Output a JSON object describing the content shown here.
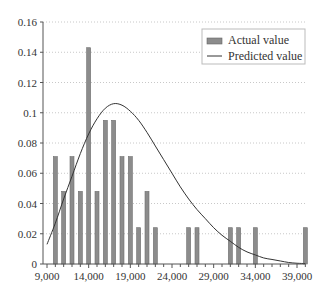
{
  "chart_data": {
    "type": "bar",
    "title": "",
    "xlabel": "",
    "ylabel": "",
    "xlim": [
      9000,
      40000
    ],
    "ylim": [
      0,
      0.16
    ],
    "grid": {
      "horizontal": true,
      "style": "dotted"
    },
    "legend_position": "upper right",
    "x_ticks": [
      "9,000",
      "14,000",
      "19,000",
      "24,000",
      "29,000",
      "34,000",
      "39,000"
    ],
    "x_tick_values": [
      9000,
      14000,
      19000,
      24000,
      29000,
      34000,
      39000
    ],
    "y_ticks": [
      "0",
      "0.02",
      "0.04",
      "0.06",
      "0.08",
      "0.1",
      "0.12",
      "0.14",
      "0.16"
    ],
    "y_tick_values": [
      0,
      0.02,
      0.04,
      0.06,
      0.08,
      0.1,
      0.12,
      0.14,
      0.16
    ],
    "series": [
      {
        "name": "Actual value",
        "type": "bar",
        "color": "#8c8c8c",
        "x": [
          10000,
          11000,
          12000,
          13000,
          14000,
          15000,
          16000,
          17000,
          18000,
          19000,
          20000,
          21000,
          22000,
          26000,
          27000,
          31000,
          32000,
          34000,
          40000
        ],
        "values": [
          0.071,
          0.048,
          0.071,
          0.048,
          0.143,
          0.048,
          0.095,
          0.095,
          0.071,
          0.071,
          0.024,
          0.048,
          0.024,
          0.024,
          0.024,
          0.024,
          0.024,
          0.024,
          0.024
        ]
      },
      {
        "name": "Predicted value",
        "type": "line",
        "color": "#333333",
        "x": [
          9000,
          10000,
          11000,
          12000,
          13000,
          14000,
          15000,
          16000,
          17000,
          18000,
          19000,
          20000,
          21000,
          22000,
          23000,
          24000,
          25000,
          26000,
          27000,
          28000,
          29000,
          30000,
          31000,
          32000,
          33000,
          34000,
          35000,
          36000,
          37000,
          38000,
          39000,
          40000
        ],
        "values": [
          0.013,
          0.027,
          0.043,
          0.058,
          0.073,
          0.086,
          0.096,
          0.103,
          0.106,
          0.105,
          0.101,
          0.095,
          0.087,
          0.078,
          0.069,
          0.06,
          0.051,
          0.043,
          0.036,
          0.03,
          0.024,
          0.019,
          0.015,
          0.011,
          0.008,
          0.006,
          0.004,
          0.003,
          0.002,
          0.001,
          0.0005,
          0.0003
        ]
      }
    ]
  },
  "legend": {
    "items": [
      {
        "label": "Actual value",
        "kind": "bar"
      },
      {
        "label": "Predicted value",
        "kind": "line"
      }
    ]
  }
}
